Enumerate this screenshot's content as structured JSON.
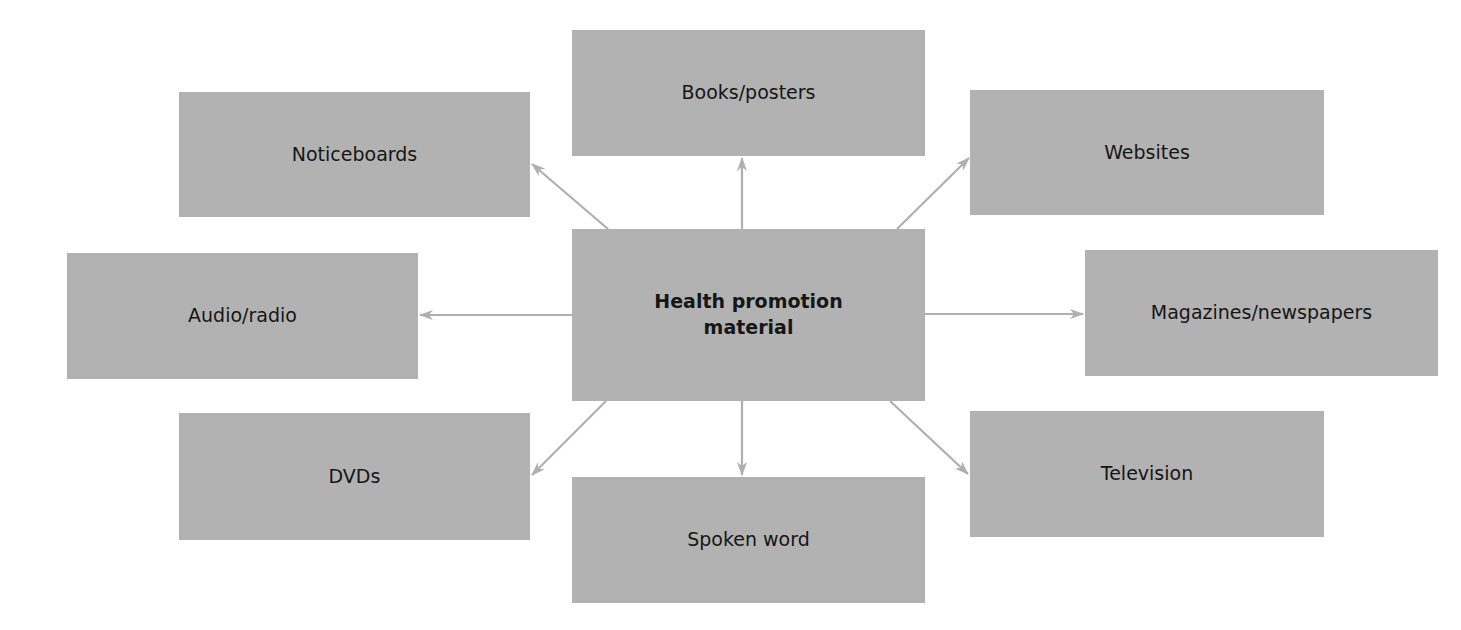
{
  "diagram": {
    "center": {
      "label": "Health promotion material",
      "lines": [
        "Health promotion",
        "material"
      ]
    },
    "nodes": [
      {
        "id": "books",
        "label": "Books/posters"
      },
      {
        "id": "noticeboards",
        "label": "Noticeboards"
      },
      {
        "id": "websites",
        "label": "Websites"
      },
      {
        "id": "audio",
        "label": "Audio/radio"
      },
      {
        "id": "magazines",
        "label": "Magazines/newspapers"
      },
      {
        "id": "dvds",
        "label": "DVDs"
      },
      {
        "id": "spoken",
        "label": "Spoken word"
      },
      {
        "id": "television",
        "label": "Television"
      }
    ],
    "edges": [
      {
        "from": "center",
        "to": "books"
      },
      {
        "from": "center",
        "to": "noticeboards"
      },
      {
        "from": "center",
        "to": "websites"
      },
      {
        "from": "center",
        "to": "audio"
      },
      {
        "from": "center",
        "to": "magazines"
      },
      {
        "from": "center",
        "to": "dvds"
      },
      {
        "from": "center",
        "to": "spoken"
      },
      {
        "from": "center",
        "to": "television"
      }
    ],
    "colors": {
      "box_fill": "#b2b2b2",
      "arrow": "#afafaf",
      "text": "#161616",
      "background": "#ffffff"
    }
  }
}
